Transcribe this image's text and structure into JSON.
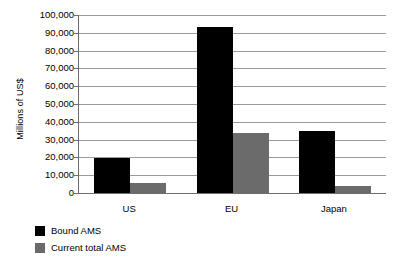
{
  "chart_data": {
    "type": "bar",
    "title": "",
    "xlabel": "",
    "ylabel": "Millions of US$",
    "categories": [
      "US",
      "EU",
      "Japan"
    ],
    "series": [
      {
        "name": "Bound AMS",
        "color": "#000000",
        "values": [
          19800,
          93000,
          34800
        ]
      },
      {
        "name": "Current total AMS",
        "color": "#6b6b6b",
        "values": [
          5600,
          33700,
          4000
        ]
      }
    ],
    "ylim": [
      0,
      100000
    ],
    "ytick_step": 10000,
    "ytick_labels": [
      "100,000",
      "90,000",
      "80,000",
      "70,000",
      "60,000",
      "50,000",
      "40,000",
      "30,000",
      "20,000",
      "10,000",
      "0"
    ],
    "grid": true,
    "legend_position": "bottom-left",
    "legend_entries": [
      "Bound AMS",
      "Current total AMS"
    ]
  }
}
